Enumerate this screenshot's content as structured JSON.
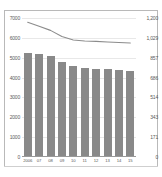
{
  "chart_data": {
    "type": "bar",
    "title": "",
    "subtitle": "",
    "xlabel": "",
    "ylabel": "",
    "categories": [
      "2006",
      "07",
      "08",
      "09",
      "10",
      "11",
      "12",
      "13",
      "14",
      "15"
    ],
    "grid": true,
    "legend": "none",
    "left_axis": {
      "label": "",
      "ylim": [
        0,
        7000
      ],
      "ticks": [
        0,
        1000,
        2000,
        3000,
        4000,
        5000,
        6000,
        7000
      ],
      "tick_labels": [
        "0",
        "1000",
        "2000",
        "3000",
        "4000",
        "5000",
        "6000",
        "7000"
      ]
    },
    "right_axis": {
      "label": "",
      "ylim": [
        0,
        1200
      ],
      "ticks": [
        0,
        171,
        343,
        514,
        686,
        857,
        1029,
        1200
      ],
      "tick_labels": [
        "0",
        "171",
        "343",
        "514",
        "686",
        "857",
        "1,029",
        "1,200"
      ]
    },
    "series": [
      {
        "name": "bars",
        "type": "bar",
        "axis": "left",
        "color": "#898989",
        "values": [
          5220,
          5190,
          5090,
          4760,
          4570,
          4460,
          4450,
          4450,
          4400,
          4350
        ]
      },
      {
        "name": "line",
        "type": "line",
        "axis": "right",
        "color": "#8c8c8c",
        "values": [
          1163,
          1128,
          1093,
          1040,
          1010,
          1002,
          998,
          993,
          989,
          984
        ]
      }
    ]
  }
}
